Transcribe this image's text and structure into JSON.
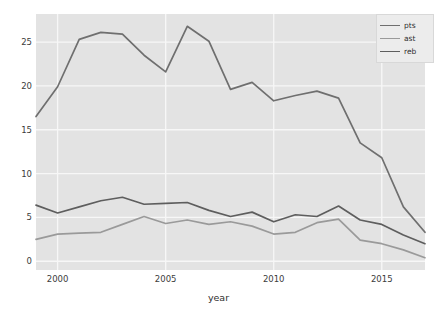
{
  "chart_data": {
    "type": "line",
    "title": "",
    "xlabel": "year",
    "ylabel": "",
    "xlim": [
      1999,
      2017
    ],
    "ylim": [
      -1.0,
      28.2
    ],
    "grid": true,
    "legend_position": "upper right",
    "xticks": [
      2000,
      2005,
      2010,
      2015
    ],
    "yticks": [
      0,
      5,
      10,
      15,
      20,
      25
    ],
    "x": [
      1999,
      2000,
      2001,
      2002,
      2003,
      2004,
      2005,
      2006,
      2007,
      2008,
      2009,
      2010,
      2011,
      2012,
      2013,
      2014,
      2015,
      2016,
      2017
    ],
    "series": [
      {
        "name": "pts",
        "color": "#6f6f6f",
        "values": [
          16.5,
          19.9,
          25.3,
          26.1,
          25.9,
          23.5,
          21.6,
          26.8,
          25.1,
          19.6,
          20.4,
          18.3,
          18.9,
          19.4,
          18.6,
          13.5,
          11.8,
          6.2,
          3.3
        ]
      },
      {
        "name": "ast",
        "color": "#9a9a9a",
        "values": [
          2.5,
          3.1,
          3.2,
          3.3,
          4.2,
          5.1,
          4.3,
          4.7,
          4.2,
          4.5,
          4.0,
          3.1,
          3.3,
          4.4,
          4.8,
          2.4,
          2.0,
          1.3,
          0.4
        ]
      },
      {
        "name": "reb",
        "color": "#5e5e5e",
        "values": [
          6.4,
          5.5,
          6.2,
          6.9,
          7.3,
          6.5,
          6.6,
          6.7,
          5.8,
          5.1,
          5.6,
          4.5,
          5.3,
          5.1,
          6.3,
          4.7,
          4.2,
          3.0,
          2.0
        ]
      }
    ]
  },
  "legend": {
    "entries": [
      {
        "label": "pts"
      },
      {
        "label": "ast"
      },
      {
        "label": "reb"
      }
    ]
  },
  "axes": {
    "x_title": "year",
    "x_tick_labels": [
      "2000",
      "2005",
      "2010",
      "2015"
    ],
    "y_tick_labels": [
      "0",
      "5",
      "10",
      "15",
      "20",
      "25"
    ]
  },
  "colors": {
    "plot_background": "#e3e3e3",
    "figure_background": "#ffffff",
    "gridline": "#f7f7f7",
    "tick_text": "#3c3c3c"
  }
}
